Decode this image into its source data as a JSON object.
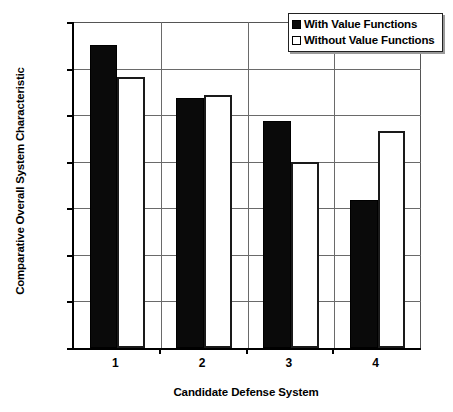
{
  "chart_data": {
    "type": "bar",
    "title": "",
    "xlabel": "Candidate Defense System",
    "ylabel": "Comparative Overall System Characteristic",
    "categories": [
      "1",
      "2",
      "3",
      "4"
    ],
    "series": [
      {
        "name": "With Value Functions",
        "swatch": "filled",
        "color": "#000000",
        "values": [
          0.325,
          0.268,
          0.244,
          0.159
        ]
      },
      {
        "name": "Without Value Functions",
        "swatch": "hollow",
        "color": "#ffffff",
        "values": [
          0.291,
          0.272,
          0.2,
          0.233
        ]
      }
    ],
    "ylim": [
      0.0,
      0.35
    ],
    "ytick_step": 0.05,
    "ytick_labels": [
      "0.000",
      "0.050",
      "0.100",
      "0.150",
      "0.200",
      "0.250",
      "0.300",
      "0.350"
    ],
    "ytick_values": [
      0.0,
      0.05,
      0.1,
      0.15,
      0.2,
      0.25,
      0.3,
      0.35
    ],
    "grid": true,
    "legend_position": "top-right"
  }
}
